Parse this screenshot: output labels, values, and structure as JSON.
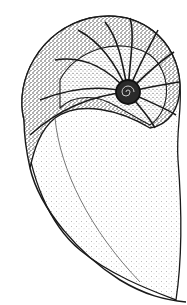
{
  "image": {
    "subject": "Nautilus shell cross-section illustration",
    "style": "stippled pen-and-ink drawing",
    "colors": {
      "background": "#ffffff",
      "ink": "#1a1a1a",
      "light_stipple": "#8a8a8a"
    }
  }
}
